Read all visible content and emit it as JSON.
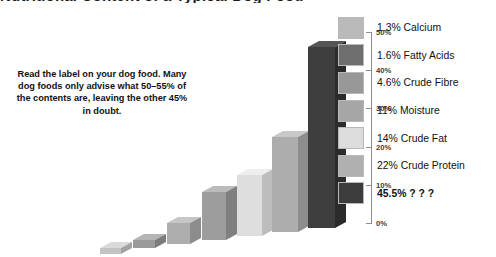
{
  "title": {
    "text": "Nutritional Content of a Typical Dog Food",
    "clipped": true
  },
  "caption": {
    "text": "Read the label on your dog food. Many dog foods only advise what 50–55% of the contents are, leaving the other 45% in doubt."
  },
  "axis": {
    "ticks": [
      {
        "label": "50%",
        "value": 50
      },
      {
        "label": "40%",
        "value": 40
      },
      {
        "label": "30%",
        "value": 30
      },
      {
        "label": "20%",
        "value": 20
      },
      {
        "label": "10%",
        "value": 10
      },
      {
        "label": "0%",
        "value": 0
      }
    ]
  },
  "legend": {
    "items": [
      {
        "label": "1.3% Calcium",
        "color": "#b9b9b9",
        "bold": false
      },
      {
        "label": "1.6%  Fatty Acids",
        "color": "#6e6e6e",
        "bold": false
      },
      {
        "label": "4.6% Crude Fibre",
        "color": "#989898",
        "bold": false
      },
      {
        "label": "11% Moisture",
        "color": "#a6a6a6",
        "bold": false
      },
      {
        "label": "14% Crude Fat",
        "color": "#dcdcdc",
        "bold": false
      },
      {
        "label": "22% Crude Protein",
        "color": "#b0b0b0",
        "bold": false
      },
      {
        "label": "45.5% ? ? ?",
        "color": "#3c3c3c",
        "bold": true
      }
    ]
  },
  "chart_data": {
    "type": "bar",
    "title": "Nutritional Content of a Typical Dog Food",
    "xlabel": "",
    "ylabel": "",
    "ylim": [
      0,
      50
    ],
    "grid": false,
    "legend_position": "right",
    "style": "3d-isometric-column",
    "categories": [
      "Calcium",
      "Fatty Acids",
      "Crude Fibre",
      "Moisture",
      "Crude Fat",
      "Crude Protein",
      "? ? ?"
    ],
    "values": [
      1.3,
      1.6,
      4.6,
      11,
      14,
      22,
      45.5
    ],
    "value_labels": [
      "1.3%",
      "1.6%",
      "4.6%",
      "11%",
      "14%",
      "22%",
      "45.5%"
    ],
    "colors": [
      "#b9b9b9",
      "#6e6e6e",
      "#989898",
      "#a6a6a6",
      "#dcdcdc",
      "#b0b0b0",
      "#3c3c3c"
    ],
    "annotation": "Read the label on your dog food. Many dog foods only advise what 50–55% of the contents are, leaving the other 45% in doubt."
  },
  "geometry": {
    "bars": [
      {
        "left": 12,
        "width": 21,
        "height": 6,
        "baseline": 238,
        "front": "#c4c4c4",
        "top": "#dadada",
        "side": "#a2a2a2"
      },
      {
        "left": 45,
        "width": 22,
        "height": 8,
        "baseline": 234,
        "front": "#9a9a9a",
        "top": "#b4b4b4",
        "side": "#7c7c7c"
      },
      {
        "left": 79,
        "width": 23,
        "height": 21,
        "baseline": 230,
        "front": "#aeaeae",
        "top": "#c6c6c6",
        "side": "#8c8c8c"
      },
      {
        "left": 114,
        "width": 24,
        "height": 48,
        "baseline": 226,
        "front": "#9d9d9d",
        "top": "#bcbcbc",
        "side": "#7f7f7f"
      },
      {
        "left": 149,
        "width": 25,
        "height": 61,
        "baseline": 222,
        "front": "#dedede",
        "top": "#eeeeee",
        "side": "#bdbdbd"
      },
      {
        "left": 184,
        "width": 26,
        "height": 95,
        "baseline": 218,
        "front": "#adadad",
        "top": "#c8c8c8",
        "side": "#8d8d8d"
      },
      {
        "left": 220,
        "width": 27,
        "height": 181,
        "baseline": 214,
        "front": "#3e3e3e",
        "top": "#555555",
        "side": "#2b2b2b"
      }
    ]
  }
}
